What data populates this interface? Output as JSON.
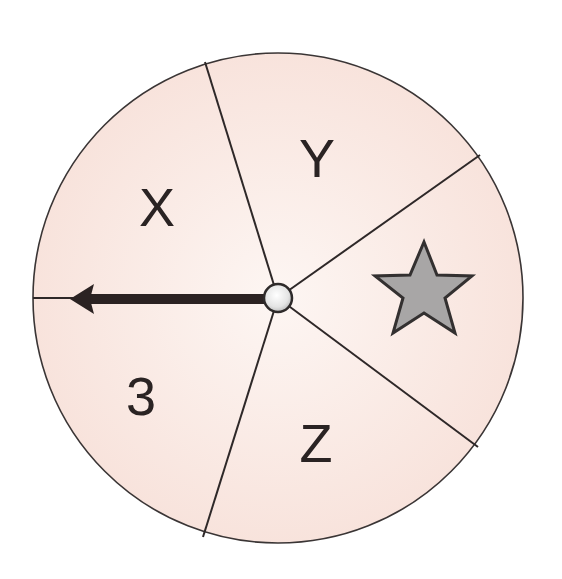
{
  "spinner": {
    "center": {
      "x": 278,
      "y": 298
    },
    "radius": 245,
    "fill_color": "#f9e6e0",
    "fill_color_light": "#fdf3f0",
    "outline_color": "#3a3535",
    "divider_endpoints": [
      {
        "x": 205,
        "y": 62
      },
      {
        "x": 480,
        "y": 155
      },
      {
        "x": 478,
        "y": 447
      },
      {
        "x": 203,
        "y": 537
      },
      {
        "x": 33,
        "y": 298
      }
    ],
    "sections": [
      {
        "label": "X",
        "x": 157,
        "y": 207
      },
      {
        "label": "Y",
        "x": 317,
        "y": 158
      },
      {
        "label": "star",
        "x": 426,
        "y": 290
      },
      {
        "label": "Z",
        "x": 316,
        "y": 443
      },
      {
        "label": "3",
        "x": 141,
        "y": 396
      }
    ],
    "labels": {
      "x": "X",
      "y": "Y",
      "z": "Z",
      "three": "3"
    },
    "star": {
      "fill_color": "#a8a6a6",
      "stroke_color": "#333030"
    },
    "arrow": {
      "direction": "left",
      "tip": {
        "x": 70,
        "y": 299
      },
      "color": "#2b2222"
    },
    "hub": {
      "radius": 14,
      "fill_color": "#eeeeee",
      "stroke_color": "#2e2a2a"
    }
  }
}
